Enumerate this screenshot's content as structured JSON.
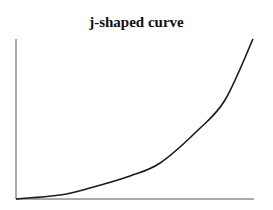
{
  "chart_data": {
    "type": "line",
    "title": "j-shaped curve",
    "xlabel": "",
    "ylabel": "",
    "xlim": [
      0,
      10
    ],
    "ylim": [
      0,
      10
    ],
    "grid": false,
    "legend": null,
    "x": [
      0,
      1.86,
      3.12,
      4.81,
      6.08,
      7.64,
      8.82,
      10
    ],
    "series": [
      {
        "name": "j-shaped curve",
        "values": [
          0,
          0.25,
          0.69,
          1.44,
          2.25,
          4.25,
          6.19,
          10
        ]
      }
    ]
  },
  "colors": {
    "line": "#1a1a1a",
    "axis": "#555555"
  }
}
